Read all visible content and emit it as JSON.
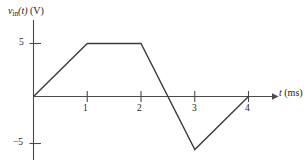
{
  "chart_data": {
    "type": "line",
    "title": "",
    "subtitle": "",
    "xlabel": "t (ms)",
    "ylabel": "v_in(t) (V)",
    "xlabel_parts": {
      "symbol": "t",
      "units": "(ms)"
    },
    "ylabel_parts": {
      "symbol": "v",
      "subscript": "in",
      "arg": "(t)",
      "units": "(V)"
    },
    "x": [
      0,
      1,
      2,
      3,
      4
    ],
    "values": [
      0,
      5,
      5,
      -5,
      0
    ],
    "series": [
      {
        "name": "v_in(t)",
        "points": [
          {
            "x": 0,
            "y": 0
          },
          {
            "x": 1,
            "y": 5
          },
          {
            "x": 2,
            "y": 5
          },
          {
            "x": 3,
            "y": -5
          },
          {
            "x": 4,
            "y": 0
          }
        ]
      }
    ],
    "zero_crossings": [
      0,
      2.5,
      4
    ],
    "xlim": [
      0,
      4.4
    ],
    "ylim": [
      -6.5,
      6.5
    ],
    "xticks": [
      1,
      2,
      3,
      4
    ],
    "xtick_labels": [
      "1",
      "2",
      "3",
      "4"
    ],
    "yticks": [
      5,
      -5
    ],
    "ytick_labels": [
      "5",
      "−5"
    ],
    "grid": false,
    "legend": false,
    "legend_position": "none",
    "line_color": "#3a3a3a",
    "axis_color": "#4a4a4a",
    "background_color": "#ffffff"
  }
}
